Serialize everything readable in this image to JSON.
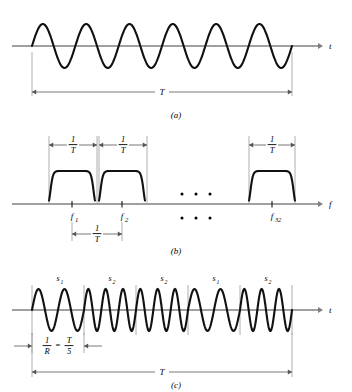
{
  "figure": {
    "colors": {
      "wave": "#111111",
      "axis": "#808080",
      "dimension": "#555555",
      "guide": "#999999",
      "background": "#ffffff"
    }
  },
  "panel_a": {
    "caption": "(a)",
    "axis_label": "t",
    "duration_label": "T",
    "axis_y": 46,
    "axis_x_start": 12,
    "axis_x_end": 318,
    "arrow_x": 322,
    "wave": {
      "x_start": 32,
      "x_end": 292,
      "cycles": 6,
      "amplitude": 22
    },
    "dimension": {
      "y": 92,
      "x1": 32,
      "x2": 292,
      "label": "T",
      "tick_top": 52
    }
  },
  "panel_b": {
    "caption": "(b)",
    "axis_label": "f",
    "axis_y": 78,
    "axis_x_start": 12,
    "axis_x_end": 318,
    "arrow_x": 322,
    "pulses": [
      {
        "center": 72,
        "half_width": 23,
        "tick_label": "f",
        "sub": "1"
      },
      {
        "center": 122,
        "half_width": 23,
        "tick_label": "f",
        "sub": "2"
      },
      {
        "center": 272,
        "half_width": 23,
        "tick_label": "f",
        "sub": "32"
      }
    ],
    "pulse_height": 33,
    "ellipsis": {
      "dots": 3,
      "x_start": 182,
      "spacing": 14,
      "y_upper": 68,
      "y_lower": 92
    },
    "top_dimensions": [
      {
        "x1": 49,
        "x2": 97,
        "label_num": "1",
        "label_den": "T"
      },
      {
        "x1": 99,
        "x2": 147,
        "label_num": "1",
        "label_den": "T"
      },
      {
        "x1": 249,
        "x2": 295,
        "label_num": "1",
        "label_den": "T"
      }
    ],
    "top_dimension_y": 19,
    "bottom_dimension": {
      "x1": 72,
      "x2": 122,
      "y": 108,
      "label_num": "1",
      "label_den": "T"
    },
    "fraction_num": "1",
    "fraction_den": "T"
  },
  "panel_c": {
    "caption": "(c)",
    "axis_label": "t",
    "axis_y": 48,
    "axis_x_start": 12,
    "axis_x_end": 318,
    "arrow_x": 322,
    "wave": {
      "x_start": 32,
      "x_end": 292,
      "amplitude": 21
    },
    "chips": [
      {
        "label": "s",
        "sub": "1",
        "cycles": 2
      },
      {
        "label": "s",
        "sub": "2",
        "cycles": 3
      },
      {
        "label": "s",
        "sub": "2",
        "cycles": 3
      },
      {
        "label": "s",
        "sub": "1",
        "cycles": 2
      },
      {
        "label": "s",
        "sub": "2",
        "cycles": 3
      }
    ],
    "chip_rate_label": {
      "num1": "1",
      "den1": "R",
      "equals": "=",
      "num2": "T",
      "den2": "5"
    },
    "chip_dimension_y": 84,
    "duration_dimension": {
      "x1": 32,
      "x2": 292,
      "y": 110,
      "label": "T"
    }
  }
}
